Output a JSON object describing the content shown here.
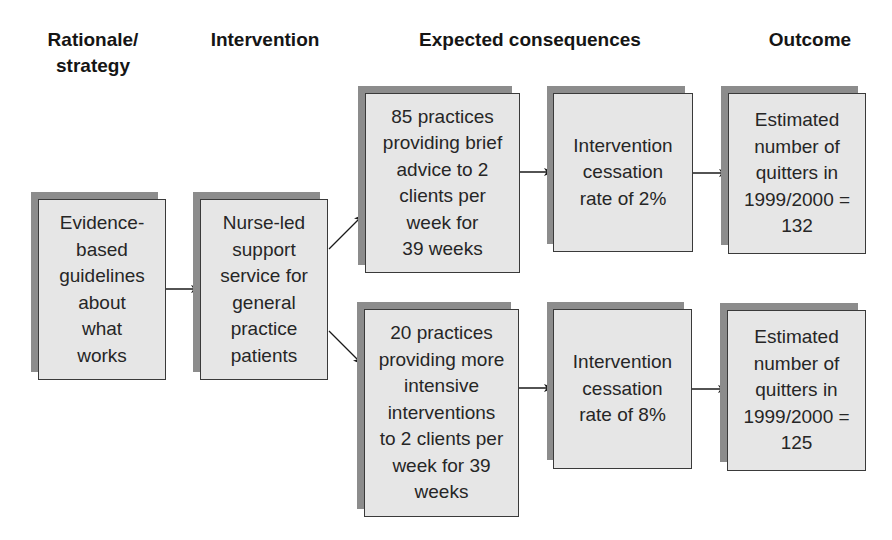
{
  "columns": [
    {
      "id": "rationale",
      "label": "Rationale/\nstrategy"
    },
    {
      "id": "intervention",
      "label": "Intervention"
    },
    {
      "id": "consequences",
      "label": "Expected consequences"
    },
    {
      "id": "outcome",
      "label": "Outcome"
    }
  ],
  "nodes": {
    "evidence": {
      "text": "Evidence-\nbased\nguidelines\nabout\nwhat\nworks"
    },
    "nurse": {
      "text": "Nurse-led\nsupport\nservice for\ngeneral\npractice\npatients"
    },
    "brief": {
      "text": "85 practices\nproviding brief\nadvice to 2\nclients per\nweek for\n39 weeks"
    },
    "intensive": {
      "text": "20 practices\nproviding more\nintensive\ninterventions\nto 2 clients per\nweek for 39\nweeks"
    },
    "rate_brief": {
      "text": "Intervention\ncessation\nrate of 2%"
    },
    "rate_intensive": {
      "text": "Intervention\ncessation\nrate of 8%"
    },
    "outcome_brief": {
      "text": "Estimated\nnumber of\nquitters in\n1999/2000 =\n132"
    },
    "outcome_intensive": {
      "text": "Estimated\nnumber of\nquitters in\n1999/2000 =\n125"
    }
  },
  "edges": [
    {
      "from": "evidence",
      "to": "nurse"
    },
    {
      "from": "nurse",
      "to": "brief"
    },
    {
      "from": "nurse",
      "to": "intensive"
    },
    {
      "from": "brief",
      "to": "rate_brief"
    },
    {
      "from": "intensive",
      "to": "rate_intensive"
    },
    {
      "from": "rate_brief",
      "to": "outcome_brief"
    },
    {
      "from": "rate_intensive",
      "to": "outcome_intensive"
    }
  ],
  "colors": {
    "box_fill": "#e6e6e6",
    "box_shadow": "#8c8c8c",
    "box_border": "#3a3a3a",
    "arrow": "#1a1a1a"
  }
}
